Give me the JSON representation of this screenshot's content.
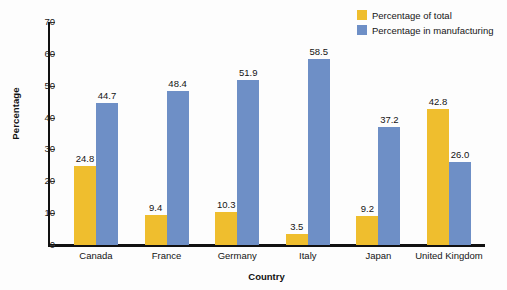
{
  "chart_data": {
    "type": "bar",
    "title": "",
    "subtitle": "",
    "xlabel": "Country",
    "ylabel": "Percentage",
    "categories": [
      "Canada",
      "France",
      "Germany",
      "Italy",
      "Japan",
      "United Kingdom"
    ],
    "series": [
      {
        "name": "Percentage of total",
        "color": "#EFBE2E",
        "values": [
          24.8,
          9.4,
          10.3,
          3.5,
          9.2,
          42.8
        ],
        "labels": [
          "24.8",
          "9.4",
          "10.3",
          "3.5",
          "9.2",
          "42.8"
        ]
      },
      {
        "name": "Percentage in manufacturing",
        "color": "#6E8FC6",
        "values": [
          44.7,
          48.4,
          51.9,
          58.5,
          37.2,
          26.0
        ],
        "labels": [
          "44.7",
          "48.4",
          "51.9",
          "58.5",
          "37.2",
          "26.0"
        ]
      }
    ],
    "ylim": [
      0,
      70
    ],
    "yticks": [
      0,
      10,
      20,
      30,
      40,
      50,
      60,
      70
    ],
    "ytick_labels": [
      "0",
      "10",
      "20",
      "30",
      "40",
      "50",
      "60",
      "70"
    ],
    "grid": false,
    "legend_position": "top-right",
    "legend": [
      {
        "label": "Percentage of total",
        "color": "#EFBE2E"
      },
      {
        "label": "Percentage in manufacturing",
        "color": "#6E8FC6"
      }
    ]
  }
}
